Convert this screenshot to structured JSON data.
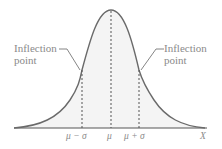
{
  "annotations": {
    "left": {
      "line1": "Inflection",
      "line2": "point"
    },
    "right": {
      "line1": "Inflection",
      "line2": "point"
    }
  },
  "axis": {
    "ticks": [
      "μ − σ",
      "μ",
      "μ + σ"
    ],
    "label": "X"
  },
  "colors": {
    "curve": "#666666",
    "fill": "#f3f3f3",
    "dash": "#555555",
    "text": "#8a8a8a"
  }
}
